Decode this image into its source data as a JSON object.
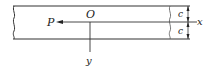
{
  "diagram": {
    "type": "beam-coordinate-diagram",
    "labels": {
      "force": "P",
      "origin": "O",
      "x_axis": "x",
      "y_axis": "y",
      "half_depth_top": "c",
      "half_depth_bottom": "c"
    },
    "colors": {
      "stroke": "#333333",
      "text": "#222222"
    }
  }
}
